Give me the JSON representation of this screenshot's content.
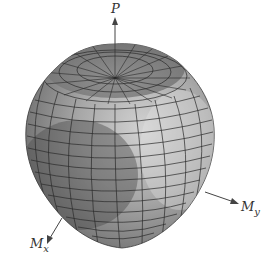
{
  "diagram": {
    "type": "3d-interaction-surface",
    "axes": [
      {
        "id": "P",
        "label": "P",
        "direction": "up"
      },
      {
        "id": "My",
        "label": "M",
        "subscript": "y",
        "direction": "right-down"
      },
      {
        "id": "Mx",
        "label": "M",
        "subscript": "x",
        "direction": "left-down"
      }
    ],
    "colors": {
      "surface_light": "#c8c8c8",
      "surface_mid": "#9a9a9a",
      "surface_dark": "#5e5e5e",
      "mesh_line": "#2a2a2a",
      "axis": "#444444",
      "background": "#ffffff"
    }
  }
}
